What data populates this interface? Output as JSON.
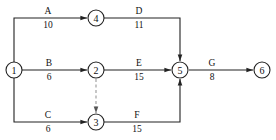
{
  "diagram": {
    "type": "activity-on-arrow network",
    "nodes": [
      {
        "id": "1",
        "label": "1"
      },
      {
        "id": "2",
        "label": "2"
      },
      {
        "id": "3",
        "label": "3"
      },
      {
        "id": "4",
        "label": "4"
      },
      {
        "id": "5",
        "label": "5"
      },
      {
        "id": "6",
        "label": "6"
      }
    ],
    "activities": [
      {
        "name": "A",
        "duration": "10",
        "from": "1",
        "to": "4"
      },
      {
        "name": "B",
        "duration": "6",
        "from": "1",
        "to": "2"
      },
      {
        "name": "C",
        "duration": "6",
        "from": "1",
        "to": "3"
      },
      {
        "name": "D",
        "duration": "11",
        "from": "4",
        "to": "5"
      },
      {
        "name": "E",
        "duration": "15",
        "from": "2",
        "to": "5"
      },
      {
        "name": "F",
        "duration": "15",
        "from": "3",
        "to": "5"
      },
      {
        "name": "G",
        "duration": "8",
        "from": "5",
        "to": "6"
      }
    ],
    "dummies": [
      {
        "from": "2",
        "to": "3",
        "style": "dashed"
      }
    ]
  }
}
